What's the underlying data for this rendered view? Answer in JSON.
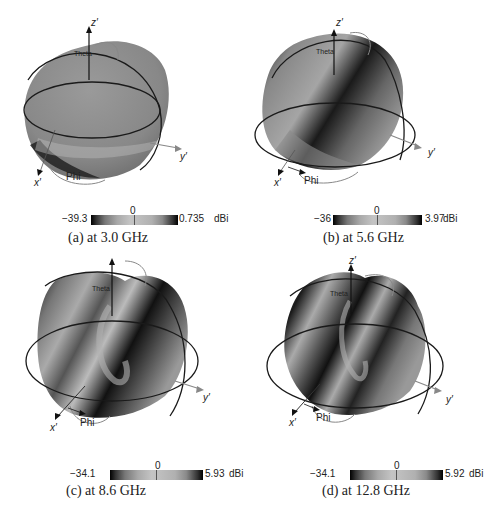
{
  "figure": {
    "panels": [
      {
        "id": "a",
        "caption": "(a) at 3.0 GHz",
        "frequency": "3.0 GHz",
        "colorbar": {
          "min": "−39.3",
          "zero": "0",
          "max": "0.735",
          "unit": "dBi"
        }
      },
      {
        "id": "b",
        "caption": "(b) at 5.6 GHz",
        "frequency": "5.6 GHz",
        "colorbar": {
          "min": "−36",
          "zero": "0",
          "max": "3.97",
          "unit": "dBi"
        }
      },
      {
        "id": "c",
        "caption": "(c) at 8.6 GHz",
        "frequency": "8.6 GHz",
        "colorbar": {
          "min": "−34.1",
          "zero": "0",
          "max": "5.93",
          "unit": "dBi"
        }
      },
      {
        "id": "d",
        "caption": "(d) at 12.8 GHz",
        "frequency": "12.8 GHz",
        "colorbar": {
          "min": "−34.1",
          "zero": "0",
          "max": "5.92",
          "unit": "dBi"
        }
      }
    ],
    "axis_labels": {
      "x": "x′",
      "y": "y′",
      "z": "z′",
      "phi": "Phi",
      "theta": "Theta"
    },
    "colors": {
      "surface_mid": "#8c8c8c",
      "surface_dark": "#111111",
      "ring_dark": "#1a1a1a",
      "ring_light": "#888888",
      "axis": "#111111",
      "y_axis": "#888888"
    }
  }
}
